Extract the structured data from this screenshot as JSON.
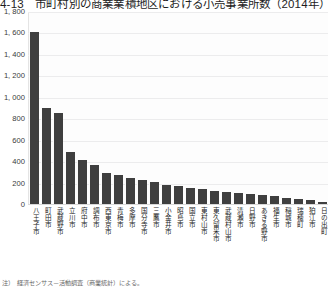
{
  "figure": {
    "title": "4-13　市町村別の商業業積地区における小売事業所数（2014年）",
    "footnote": "注）　経済センサス－活動調査（商業統計）による。"
  },
  "chart_data": {
    "type": "bar",
    "title": "4-13　市町村別の商業業積地区における小売事業所数（2014年）",
    "xlabel": "",
    "ylabel": "",
    "ylim": [
      0,
      1800
    ],
    "ytick_step": 200,
    "grid": true,
    "legend": "none",
    "bar_color": "#3f3f3f",
    "ytick_labels": [
      "1, 800",
      "1, 600",
      "1, 400",
      "1, 200",
      "1, 000",
      "800",
      "600",
      "400",
      "200",
      "0"
    ],
    "categories": [
      "八王子市",
      "町田市",
      "武蔵野市",
      "立川市",
      "府中市",
      "調布市",
      "西東京市",
      "青梅市",
      "多摩市",
      "国分寺市",
      "三鷹市",
      "小金井市",
      "昭島市",
      "国立市",
      "東村山市",
      "東久留米市",
      "武蔵村山市",
      "清瀬市",
      "日野市",
      "あきる野市",
      "福生市",
      "稲城市",
      "瑞穂町",
      "狛江市",
      "日の出町"
    ],
    "values": [
      1610,
      905,
      855,
      495,
      420,
      370,
      300,
      280,
      255,
      235,
      210,
      190,
      175,
      160,
      145,
      130,
      120,
      110,
      100,
      90,
      80,
      70,
      60,
      45,
      25
    ]
  }
}
